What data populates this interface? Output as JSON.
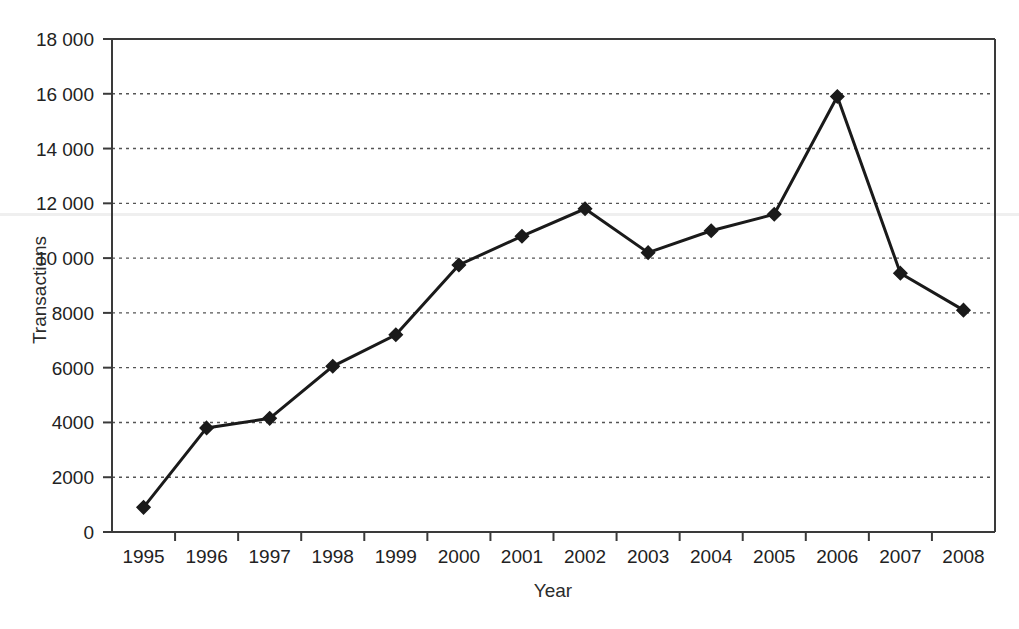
{
  "chart_data": {
    "type": "line",
    "title": "",
    "xlabel": "Year",
    "ylabel": "Transactions",
    "categories": [
      "1995",
      "1996",
      "1997",
      "1998",
      "1999",
      "2000",
      "2001",
      "2002",
      "2003",
      "2004",
      "2005",
      "2006",
      "2007",
      "2008"
    ],
    "values": [
      900,
      3800,
      4150,
      6050,
      7200,
      9750,
      10800,
      11800,
      10200,
      11000,
      11600,
      15900,
      9450,
      8100
    ],
    "series": [
      {
        "name": "Transactions",
        "values": [
          900,
          3800,
          4150,
          6050,
          7200,
          9750,
          10800,
          11800,
          10200,
          11000,
          11600,
          15900,
          9450,
          8100
        ]
      }
    ],
    "x": [
      "1995",
      "1996",
      "1997",
      "1998",
      "1999",
      "2000",
      "2001",
      "2002",
      "2003",
      "2004",
      "2005",
      "2006",
      "2007",
      "2008"
    ],
    "xlim": [
      1994.5,
      2008.5
    ],
    "ylim": [
      0,
      18000
    ],
    "ytick_values": [
      0,
      2000,
      4000,
      6000,
      8000,
      10000,
      12000,
      14000,
      16000,
      18000
    ],
    "ytick_labels": [
      "0",
      "2000",
      "4000",
      "6000",
      "8000",
      "10 000",
      "12 000",
      "14 000",
      "16 000",
      "18 000"
    ],
    "xtick_labels": [
      "1995",
      "1996",
      "1997",
      "1998",
      "1999",
      "2000",
      "2001",
      "2002",
      "2003",
      "2004",
      "2005",
      "2006",
      "2007",
      "2008"
    ],
    "grid": "horizontal-dotted",
    "legend": "none",
    "legend_position": "none",
    "marker": "filled-diamond",
    "line_color": "#1a1a1a",
    "marker_color": "#1a1a1a",
    "grid_color": "#555555",
    "axis_color": "#3a3a3a",
    "background_color": "#ffffff"
  }
}
